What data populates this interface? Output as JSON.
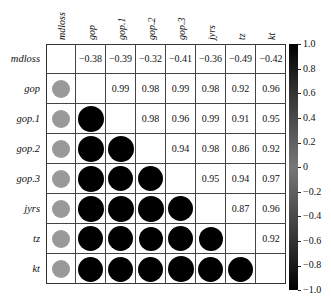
{
  "chart_data": {
    "type": "heatmap",
    "subtype": "correlation-matrix (upper: numbers, lower: circles)",
    "variables": [
      "mdloss",
      "gop",
      "gop.1",
      "gop.2",
      "gop.3",
      "jyrs",
      "tz",
      "kt"
    ],
    "matrix": [
      [
        1.0,
        -0.38,
        -0.39,
        -0.32,
        -0.41,
        -0.36,
        -0.49,
        -0.42
      ],
      [
        -0.38,
        1.0,
        0.99,
        0.98,
        0.99,
        0.98,
        0.92,
        0.96
      ],
      [
        -0.39,
        0.99,
        1.0,
        0.98,
        0.96,
        0.99,
        0.91,
        0.95
      ],
      [
        -0.32,
        0.98,
        0.98,
        1.0,
        0.94,
        0.98,
        0.86,
        0.92
      ],
      [
        -0.41,
        0.99,
        0.96,
        0.94,
        1.0,
        0.95,
        0.94,
        0.97
      ],
      [
        -0.36,
        0.98,
        0.99,
        0.98,
        0.95,
        1.0,
        0.87,
        0.96
      ],
      [
        -0.49,
        0.92,
        0.91,
        0.86,
        0.94,
        0.87,
        1.0,
        0.92
      ],
      [
        -0.42,
        0.96,
        0.95,
        0.92,
        0.97,
        0.96,
        0.92,
        1.0
      ]
    ],
    "colorbar": {
      "ticks": [
        "1.0",
        "0.8",
        "0.6",
        "0.4",
        "0.2",
        "0",
        "−0.2",
        "−0.4",
        "−0.6",
        "−0.8",
        "−1.0"
      ],
      "range": [
        -1.0,
        1.0
      ]
    },
    "title": "",
    "xlabel": "",
    "ylabel": ""
  }
}
